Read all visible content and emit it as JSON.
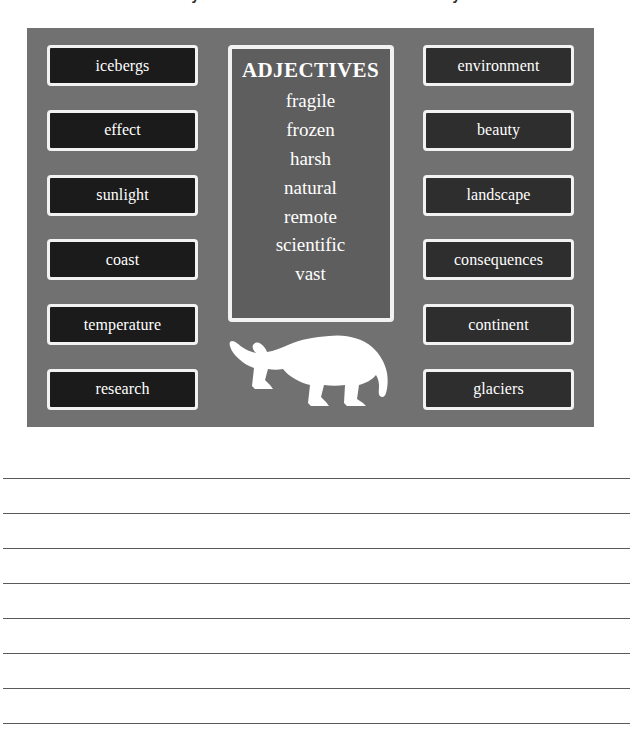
{
  "worksheet": {
    "clipped_header_text": "Antarctica Vocabulary — use the word bank below to write your own sentences",
    "poster": {
      "background_color": "#717171",
      "left_column": {
        "words": [
          "icebergs",
          "effect",
          "sunlight",
          "coast",
          "temperature",
          "research"
        ]
      },
      "center_column": {
        "panel_title": "ADJECTIVES",
        "panel_background_color": "#5e5e5e",
        "adjectives": [
          "fragile",
          "frozen",
          "harsh",
          "natural",
          "remote",
          "scientific",
          "vast"
        ],
        "illustration": "polar-bear-silhouette",
        "illustration_color": "#ffffff"
      },
      "right_column": {
        "words": [
          "environment",
          "beauty",
          "landscape",
          "consequences",
          "continent",
          "glaciers"
        ]
      },
      "word_box_background_color": "#1b1b1b",
      "word_box_border_color": "#f2f2f2",
      "word_text_color": "#ffffff"
    },
    "writing_lines": {
      "count": 8,
      "line_color": "#5a5a5a",
      "spacing_px": 35,
      "first_line_y": 38
    }
  }
}
